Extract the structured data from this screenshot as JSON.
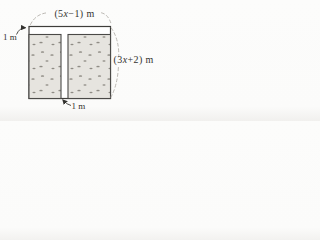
{
  "figure": {
    "labels": {
      "top_width": {
        "pre": "(5",
        "variable": "x",
        "post": "−1) m"
      },
      "right_height": {
        "pre": "(3",
        "variable": "x",
        "post": "+2) m"
      },
      "top_margin": "1 m",
      "center_gap": "1 m"
    },
    "colors": {
      "background": "#fbfbfa",
      "surface": "#ffffff",
      "outline": "#3e3d3a",
      "panel_fill": "#e6e4df",
      "panel_stroke": "#4a4947",
      "speckle": "#8f8c85",
      "dashed_guide": "#b4b1ac",
      "text": "#33322f"
    }
  }
}
